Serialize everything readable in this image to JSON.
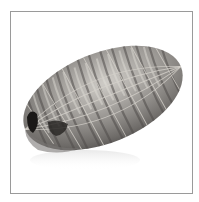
{
  "image": {
    "subject": "netted roast",
    "alt": "Grayscale product photo of an elongated netted meat roast on a white background inside a thin gray frame",
    "colors": {
      "background": "#ffffff",
      "frame": "#9a9a9a",
      "highlight": "#d8d6d2",
      "midtone": "#8a8885",
      "shadow": "#3a3836",
      "cavity": "#1a1817",
      "netting": "#c9c6c0"
    }
  }
}
